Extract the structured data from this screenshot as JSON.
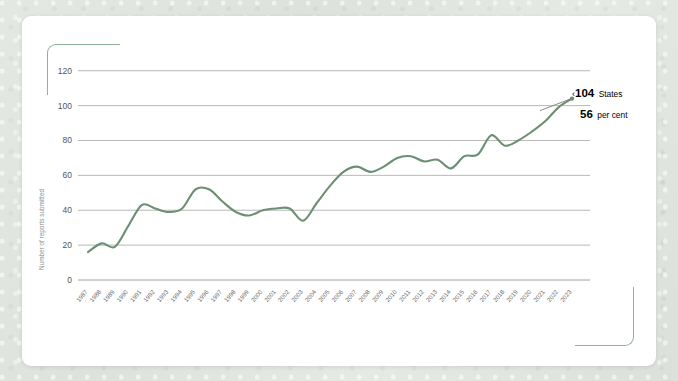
{
  "card": {
    "background_color": "#ffffff",
    "corner_bracket_color": "#8fb396"
  },
  "annotation": {
    "chevron": "‹",
    "value_states": "104",
    "label_states": "States",
    "value_percent": "56",
    "label_percent": "per cent"
  },
  "chart_data": {
    "type": "line",
    "title": "",
    "xlabel": "",
    "ylabel": "Number of reports submitted",
    "ylim": [
      0,
      125
    ],
    "yticks": [
      0,
      20,
      40,
      60,
      80,
      100,
      120
    ],
    "ytick_labels": [
      "0",
      "20",
      "40",
      "60",
      "80",
      "100",
      "120"
    ],
    "grid": true,
    "legend": "none",
    "line_color": "#6b8f72",
    "categories": [
      "1987",
      "1988",
      "1989",
      "1990",
      "1991",
      "1992",
      "1993",
      "1994",
      "1995",
      "1996",
      "1997",
      "1998",
      "1999",
      "2000",
      "2001",
      "2002",
      "2003",
      "2004",
      "2005",
      "2006",
      "2007",
      "2008",
      "2009",
      "2010",
      "2011",
      "2012",
      "2013",
      "2014",
      "2015",
      "2016",
      "2017",
      "2018",
      "2019",
      "2020",
      "2021",
      "2022",
      "2023"
    ],
    "values": [
      16,
      21,
      19,
      31,
      43,
      41,
      39,
      41,
      52,
      52,
      45,
      39,
      37,
      40,
      41,
      41,
      34,
      44,
      54,
      62,
      65,
      62,
      65,
      70,
      71,
      68,
      69,
      64,
      71,
      72,
      83,
      77,
      80,
      85,
      91,
      99,
      104
    ],
    "series": [
      {
        "name": "Number of reports submitted",
        "color": "#6b8f72",
        "values": [
          16,
          21,
          19,
          31,
          43,
          41,
          39,
          41,
          52,
          52,
          45,
          39,
          37,
          40,
          41,
          41,
          34,
          44,
          54,
          62,
          65,
          62,
          65,
          70,
          71,
          68,
          69,
          64,
          71,
          72,
          83,
          77,
          80,
          85,
          91,
          99,
          104
        ]
      }
    ],
    "annotations": [
      {
        "x": "2023",
        "y": 104,
        "text": "104 States"
      },
      {
        "x": "2023",
        "y": 104,
        "text": "56 per cent"
      }
    ]
  }
}
